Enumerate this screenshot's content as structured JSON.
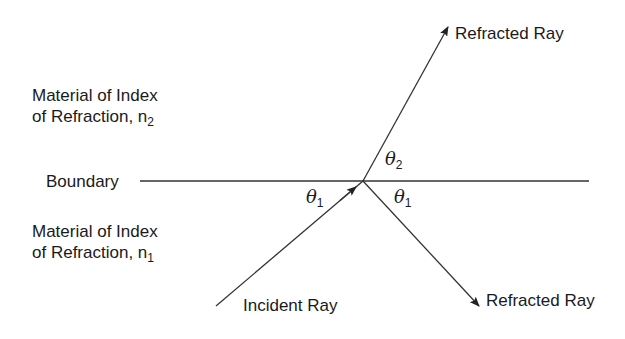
{
  "diagram": {
    "labels": {
      "material_upper_line1": "Material of Index",
      "material_upper_line2": "of Refraction, n",
      "material_upper_subscript": "2",
      "material_lower_line1": "Material of Index",
      "material_lower_line2": "of Refraction, n",
      "material_lower_subscript": "1",
      "boundary": "Boundary",
      "incident_ray": "Incident Ray",
      "refracted_ray_upper": "Refracted Ray",
      "refracted_ray_lower": "Refracted Ray",
      "theta_symbol": "θ",
      "theta1_left_sub": "1",
      "theta2_sub": "2",
      "theta1_right_sub": "1"
    },
    "geometry": {
      "boundary_line": {
        "x1": 140,
        "y1": 181,
        "x2": 589,
        "y2": 181
      },
      "intersection": {
        "x": 363,
        "y": 181
      },
      "incident_ray": {
        "x1": 216,
        "y1": 306,
        "x2": 363,
        "y2": 181
      },
      "refracted_ray_upper": {
        "x1": 363,
        "y1": 181,
        "x2": 448,
        "y2": 27
      },
      "refracted_ray_lower": {
        "x1": 363,
        "y1": 181,
        "x2": 479,
        "y2": 306
      }
    },
    "colors": {
      "line": "#333333",
      "text": "#1a1a1a",
      "background": "#ffffff"
    }
  }
}
